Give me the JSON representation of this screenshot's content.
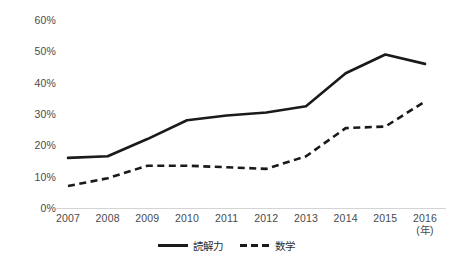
{
  "chart_data": {
    "type": "line",
    "title": "",
    "xlabel": "(年)",
    "ylabel": "",
    "x": [
      "2007",
      "2008",
      "2009",
      "2010",
      "2011",
      "2012",
      "2013",
      "2014",
      "2015",
      "2016"
    ],
    "categories": [
      "2007",
      "2008",
      "2009",
      "2010",
      "2011",
      "2012",
      "2013",
      "2014",
      "2015",
      "2016"
    ],
    "series": [
      {
        "name": "読解力",
        "style": "solid",
        "color": "#1a1a1a",
        "values": [
          16,
          16.5,
          22,
          28,
          29.5,
          30.5,
          32.5,
          43,
          49,
          46
        ]
      },
      {
        "name": "数学",
        "style": "dashed",
        "color": "#1a1a1a",
        "values": [
          7,
          9.5,
          13.5,
          13.5,
          13,
          12.5,
          16.5,
          25.5,
          26,
          34
        ]
      }
    ],
    "ylim": [
      0,
      60
    ],
    "yticks": [
      0,
      10,
      20,
      30,
      40,
      50,
      60
    ],
    "ytick_labels": [
      "0%",
      "10%",
      "20%",
      "30%",
      "40%",
      "50%",
      "60%"
    ],
    "xlim": [
      "2007",
      "2016"
    ],
    "grid": false,
    "legend_position": "bottom-center",
    "axis_color": "#d4d4d4",
    "text_color": "#4a4a4a"
  },
  "legend": {
    "items": [
      {
        "label": "読解力",
        "style": "solid"
      },
      {
        "label": "数学",
        "style": "dashed"
      }
    ]
  },
  "axis": {
    "x_unit_label": "(年)"
  }
}
